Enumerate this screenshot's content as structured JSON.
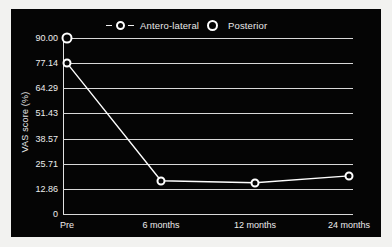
{
  "chart_data": {
    "type": "line",
    "title": "",
    "xlabel": "",
    "ylabel": "VAS score (%)",
    "categories": [
      "Pre",
      "6 months",
      "12 months",
      "24 months"
    ],
    "ylim": [
      0,
      90
    ],
    "yticks": [
      "0",
      "12.86",
      "25.71",
      "38.57",
      "51.43",
      "64.29",
      "77.14",
      "90.00"
    ],
    "ytick_values": [
      0,
      12.86,
      25.71,
      38.57,
      51.43,
      64.29,
      77.14,
      90.0
    ],
    "grid": true,
    "legend_position": "top",
    "series": [
      {
        "name": "Antero-lateral",
        "marker": "open-circle",
        "line": "solid",
        "color": "#ffffff",
        "values": [
          77.14,
          17.0,
          16.0,
          19.5
        ]
      },
      {
        "name": "Posterior",
        "marker": "open-circle-bold",
        "line": "none",
        "color": "#ffffff",
        "values": [
          90.0,
          null,
          null,
          null
        ]
      }
    ]
  },
  "legend": {
    "items": [
      {
        "label": "Antero-lateral",
        "marker": "dashed-open-circle"
      },
      {
        "label": "Posterior",
        "marker": "bold-open-circle"
      }
    ]
  },
  "colors": {
    "panel_background": "#050505",
    "page_background": "#f2f2f0",
    "gridline": "#d8d8d8",
    "text": "#ededed",
    "series": "#ffffff"
  }
}
